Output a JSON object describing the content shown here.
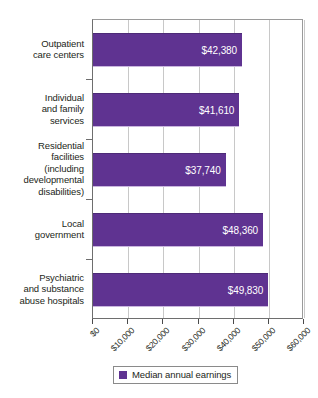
{
  "chart_data": {
    "type": "bar",
    "orientation": "horizontal",
    "title": "",
    "xlabel": "",
    "ylabel": "",
    "xlim": [
      0,
      60000
    ],
    "grid": true,
    "legend_position": "bottom",
    "series_color": "#5f3391",
    "categories": [
      "Outpatient care centers",
      "Individual and family services",
      "Residential facilities (including developmental disabilities)",
      "Local government",
      "Psychiatric and substance abuse hospitals"
    ],
    "category_lines": [
      [
        "Outpatient",
        "care centers"
      ],
      [
        "Individual",
        "and family",
        "services"
      ],
      [
        "Residential",
        "facilities",
        "(including",
        "developmental",
        "disabilities)"
      ],
      [
        "Local",
        "government"
      ],
      [
        "Psychiatric",
        "and substance",
        "abuse hospitals"
      ]
    ],
    "values": [
      42380,
      41610,
      37740,
      48360,
      49830
    ],
    "value_labels": [
      "$42,380",
      "$41,610",
      "$37,740",
      "$48,360",
      "$49,830"
    ],
    "xticks": [
      0,
      10000,
      20000,
      30000,
      40000,
      50000,
      60000
    ],
    "xtick_labels": [
      "$0",
      "$10,000",
      "$20,000",
      "$30,000",
      "$40,000",
      "$50,000",
      "$60,000"
    ],
    "series": [
      {
        "name": "Median annual earnings",
        "values": [
          42380,
          41610,
          37740,
          48360,
          49830
        ]
      }
    ]
  },
  "legend": {
    "label": "Median annual earnings"
  }
}
